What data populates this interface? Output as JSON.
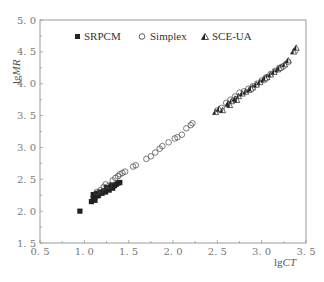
{
  "chart_data": {
    "type": "scatter",
    "title": "",
    "xlabel": "lgCT",
    "ylabel": "lgMR",
    "xlim": [
      0.5,
      3.5
    ],
    "ylim": [
      1.5,
      5.0
    ],
    "xticks": [
      "0.5",
      "1.0",
      "1.5",
      "2.0",
      "2.5",
      "3.0",
      "3.5"
    ],
    "yticks": [
      "1.5",
      "2.0",
      "2.5",
      "3.0",
      "3.5",
      "4.0",
      "4.5",
      "5.0"
    ],
    "grid": false,
    "legend_position": "top-inside",
    "series": [
      {
        "name": "SRPCM",
        "marker": "filled-square",
        "points": [
          [
            0.95,
            2.0
          ],
          [
            1.08,
            2.15
          ],
          [
            1.1,
            2.2
          ],
          [
            1.1,
            2.26
          ],
          [
            1.12,
            2.22
          ],
          [
            1.14,
            2.28
          ],
          [
            1.16,
            2.25
          ],
          [
            1.18,
            2.3
          ],
          [
            1.2,
            2.28
          ],
          [
            1.22,
            2.32
          ],
          [
            1.24,
            2.3
          ],
          [
            1.26,
            2.35
          ],
          [
            1.28,
            2.33
          ],
          [
            1.3,
            2.38
          ],
          [
            1.32,
            2.36
          ],
          [
            1.34,
            2.4
          ],
          [
            1.36,
            2.42
          ],
          [
            1.38,
            2.44
          ],
          [
            1.4,
            2.45
          ],
          [
            1.12,
            2.17
          ],
          [
            1.15,
            2.24
          ],
          [
            1.25,
            2.37
          ],
          [
            1.31,
            2.41
          ]
        ]
      },
      {
        "name": "Simplex",
        "marker": "open-circle",
        "points": [
          [
            1.14,
            2.3
          ],
          [
            1.18,
            2.33
          ],
          [
            1.22,
            2.38
          ],
          [
            1.24,
            2.42
          ],
          [
            1.28,
            2.4
          ],
          [
            1.32,
            2.48
          ],
          [
            1.35,
            2.52
          ],
          [
            1.38,
            2.55
          ],
          [
            1.4,
            2.58
          ],
          [
            1.43,
            2.6
          ],
          [
            1.46,
            2.62
          ],
          [
            1.55,
            2.7
          ],
          [
            1.58,
            2.72
          ],
          [
            1.7,
            2.82
          ],
          [
            1.75,
            2.86
          ],
          [
            1.8,
            2.92
          ],
          [
            1.85,
            2.98
          ],
          [
            1.88,
            3.02
          ],
          [
            1.95,
            3.08
          ],
          [
            2.02,
            3.14
          ],
          [
            2.05,
            3.16
          ],
          [
            2.1,
            3.2
          ],
          [
            2.15,
            3.3
          ],
          [
            2.2,
            3.35
          ],
          [
            2.22,
            3.38
          ],
          [
            2.5,
            3.58
          ],
          [
            2.55,
            3.62
          ],
          [
            2.6,
            3.7
          ],
          [
            2.65,
            3.75
          ],
          [
            2.7,
            3.8
          ],
          [
            2.75,
            3.86
          ],
          [
            2.8,
            3.88
          ],
          [
            2.85,
            3.92
          ],
          [
            2.9,
            3.96
          ],
          [
            2.95,
            4.0
          ],
          [
            3.0,
            4.05
          ],
          [
            3.05,
            4.1
          ],
          [
            3.1,
            4.15
          ],
          [
            3.15,
            4.2
          ],
          [
            3.2,
            4.25
          ],
          [
            3.25,
            4.28
          ],
          [
            3.3,
            4.34
          ],
          [
            3.38,
            4.52
          ]
        ]
      },
      {
        "name": "SCE-UA",
        "marker": "half-filled-triangle",
        "points": [
          [
            2.48,
            3.55
          ],
          [
            2.52,
            3.6
          ],
          [
            2.56,
            3.58
          ],
          [
            2.62,
            3.68
          ],
          [
            2.66,
            3.72
          ],
          [
            2.7,
            3.76
          ],
          [
            2.74,
            3.8
          ],
          [
            2.78,
            3.84
          ],
          [
            2.82,
            3.87
          ],
          [
            2.86,
            3.9
          ],
          [
            2.9,
            3.94
          ],
          [
            2.94,
            3.98
          ],
          [
            2.98,
            4.02
          ],
          [
            3.02,
            4.06
          ],
          [
            3.06,
            4.1
          ],
          [
            3.1,
            4.14
          ],
          [
            3.14,
            4.18
          ],
          [
            3.18,
            4.22
          ],
          [
            3.22,
            4.26
          ],
          [
            3.26,
            4.3
          ],
          [
            3.3,
            4.36
          ],
          [
            3.36,
            4.5
          ],
          [
            3.39,
            4.56
          ],
          [
            2.64,
            3.66
          ],
          [
            2.72,
            3.74
          ],
          [
            2.88,
            3.92
          ],
          [
            3.04,
            4.08
          ],
          [
            3.2,
            4.24
          ]
        ]
      }
    ]
  },
  "legend": {
    "items": [
      {
        "label": "SRPCM"
      },
      {
        "label": "Simplex"
      },
      {
        "label": "SCE-UA"
      }
    ]
  },
  "axes": {
    "x_title_prefix": "lg",
    "x_title_italic": "CT",
    "y_title_prefix": "lg",
    "y_title_italic": "MR"
  },
  "colors": {
    "axis": "#999999",
    "marker": "#222222",
    "tick_label": "#777777"
  }
}
